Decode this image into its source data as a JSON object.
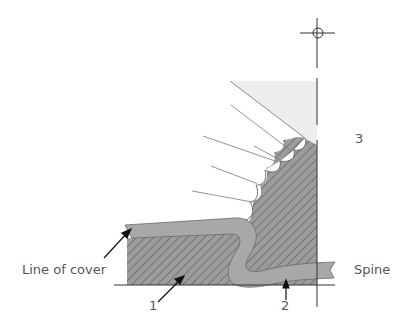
{
  "diagram": {
    "labels": {
      "line_of_cover": "Line of cover",
      "spine": "Spine",
      "callout_1": "1",
      "callout_2": "2",
      "callout_3": "3"
    },
    "colors": {
      "hatch_fill": "#9a9a9a",
      "hatch_line": "#555555",
      "cover_band": "#a8a8a8",
      "light_region": "#eeeeee",
      "line": "#333333",
      "text": "#555555"
    }
  }
}
